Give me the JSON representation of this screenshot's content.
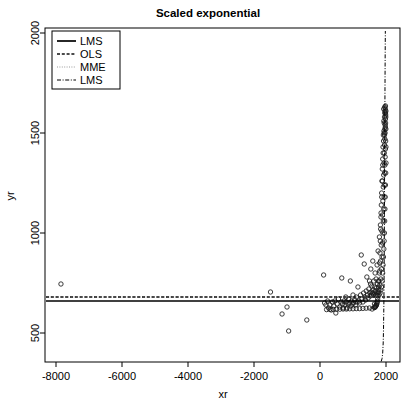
{
  "chart_data": {
    "type": "scatter",
    "title": "Scaled exponential",
    "xlabel": "xr",
    "ylabel": "yr",
    "grid": false,
    "xlim": [
      -8600,
      2300
    ],
    "ylim": [
      280,
      2030
    ],
    "xticks": [
      -8000,
      -6000,
      -4000,
      -2000,
      0,
      2000
    ],
    "xticklabels": [
      "-8000",
      "-6000",
      "-4000",
      "-2000",
      "0",
      "2000"
    ],
    "yticks": [
      500,
      1000,
      1500,
      2000
    ],
    "yticklabels": [
      "500",
      "1000",
      "1500",
      "2000"
    ],
    "legend": {
      "position": "top-left",
      "entries": [
        {
          "label": "LMS",
          "style": "solid"
        },
        {
          "label": "OLS",
          "style": "dashed"
        },
        {
          "label": "MME",
          "style": "dotted"
        },
        {
          "label": "LMS",
          "style": "dashdot"
        }
      ]
    },
    "series": [
      {
        "name": "data points",
        "type": "scatter",
        "marker": "open-circle",
        "points": [
          [
            -7850,
            745
          ],
          [
            -1500,
            705
          ],
          [
            -1150,
            595
          ],
          [
            -1000,
            630
          ],
          [
            -950,
            510
          ],
          [
            -400,
            565
          ],
          [
            110,
            790
          ],
          [
            140,
            650
          ],
          [
            180,
            640
          ],
          [
            230,
            660
          ],
          [
            260,
            625
          ],
          [
            300,
            640
          ],
          [
            340,
            615
          ],
          [
            380,
            655
          ],
          [
            420,
            635
          ],
          [
            450,
            660
          ],
          [
            480,
            600
          ],
          [
            520,
            645
          ],
          [
            560,
            670
          ],
          [
            600,
            630
          ],
          [
            640,
            655
          ],
          [
            660,
            775
          ],
          [
            680,
            645
          ],
          [
            700,
            625
          ],
          [
            730,
            660
          ],
          [
            760,
            640
          ],
          [
            780,
            680
          ],
          [
            800,
            655
          ],
          [
            820,
            625
          ],
          [
            850,
            645
          ],
          [
            870,
            670
          ],
          [
            900,
            650
          ],
          [
            920,
            760
          ],
          [
            940,
            635
          ],
          [
            960,
            660
          ],
          [
            980,
            645
          ],
          [
            1000,
            690
          ],
          [
            1020,
            650
          ],
          [
            1050,
            665
          ],
          [
            1080,
            640
          ],
          [
            1100,
            680
          ],
          [
            1120,
            655
          ],
          [
            1150,
            730
          ],
          [
            1180,
            660
          ],
          [
            1200,
            650
          ],
          [
            1230,
            690
          ],
          [
            1250,
            890
          ],
          [
            1270,
            670
          ],
          [
            1300,
            655
          ],
          [
            1320,
            700
          ],
          [
            1340,
            845
          ],
          [
            1360,
            680
          ],
          [
            1380,
            665
          ],
          [
            1400,
            710
          ],
          [
            1420,
            780
          ],
          [
            1440,
            690
          ],
          [
            1460,
            675
          ],
          [
            1480,
            720
          ],
          [
            1500,
            760
          ],
          [
            1510,
            700
          ],
          [
            1520,
            685
          ],
          [
            1530,
            745
          ],
          [
            1540,
            820
          ],
          [
            1550,
            705
          ],
          [
            1560,
            690
          ],
          [
            1570,
            735
          ],
          [
            1580,
            620
          ],
          [
            1590,
            700
          ],
          [
            1600,
            860
          ],
          [
            1610,
            715
          ],
          [
            1620,
            690
          ],
          [
            1630,
            760
          ],
          [
            1640,
            700
          ],
          [
            1650,
            645
          ],
          [
            1660,
            730
          ],
          [
            1670,
            800
          ],
          [
            1680,
            710
          ],
          [
            1690,
            690
          ],
          [
            1700,
            770
          ],
          [
            1710,
            725
          ],
          [
            1720,
            690
          ],
          [
            1730,
            840
          ],
          [
            1740,
            745
          ],
          [
            1750,
            700
          ],
          [
            1760,
            910
          ],
          [
            1770,
            760
          ],
          [
            1780,
            715
          ],
          [
            1790,
            690
          ],
          [
            1800,
            980
          ],
          [
            1810,
            810
          ],
          [
            1815,
            740
          ],
          [
            1820,
            700
          ],
          [
            1830,
            1040
          ],
          [
            1835,
            860
          ],
          [
            1840,
            770
          ],
          [
            1845,
            715
          ],
          [
            1850,
            1100
          ],
          [
            1855,
            940
          ],
          [
            1860,
            820
          ],
          [
            1865,
            730
          ],
          [
            1870,
            1180
          ],
          [
            1875,
            1010
          ],
          [
            1880,
            880
          ],
          [
            1885,
            760
          ],
          [
            1890,
            1260
          ],
          [
            1893,
            1090
          ],
          [
            1896,
            950
          ],
          [
            1899,
            800
          ],
          [
            1902,
            1340
          ],
          [
            1905,
            1160
          ],
          [
            1908,
            1000
          ],
          [
            1911,
            840
          ],
          [
            1914,
            1400
          ],
          [
            1917,
            1230
          ],
          [
            1920,
            1060
          ],
          [
            1923,
            880
          ],
          [
            1926,
            1460
          ],
          [
            1929,
            1290
          ],
          [
            1932,
            1120
          ],
          [
            1935,
            920
          ],
          [
            1938,
            1510
          ],
          [
            1940,
            1350
          ],
          [
            1942,
            1180
          ],
          [
            1944,
            960
          ],
          [
            1946,
            1550
          ],
          [
            1948,
            1400
          ],
          [
            1950,
            1240
          ],
          [
            1952,
            1000
          ],
          [
            1954,
            1580
          ],
          [
            1956,
            1440
          ],
          [
            1958,
            1300
          ],
          [
            1960,
            1060
          ],
          [
            1962,
            1600
          ],
          [
            1964,
            1470
          ],
          [
            1966,
            1340
          ],
          [
            1968,
            1120
          ],
          [
            1970,
            1610
          ],
          [
            1972,
            1500
          ],
          [
            1974,
            1380
          ],
          [
            1976,
            1180
          ],
          [
            1978,
            1620
          ],
          [
            1980,
            1530
          ],
          [
            1982,
            1420
          ],
          [
            1984,
            1240
          ],
          [
            1986,
            1600
          ],
          [
            1988,
            1550
          ],
          [
            1990,
            1460
          ],
          [
            1992,
            1300
          ],
          [
            1994,
            1580
          ],
          [
            1996,
            1520
          ],
          [
            1998,
            1430
          ],
          [
            2000,
            1350
          ],
          [
            1935,
            1560
          ],
          [
            1945,
            1500
          ],
          [
            1955,
            1490
          ],
          [
            1965,
            1520
          ],
          [
            1975,
            1540
          ],
          [
            1985,
            1570
          ],
          [
            1991,
            1590
          ],
          [
            1997,
            1610
          ],
          [
            1930,
            1620
          ],
          [
            1960,
            1630
          ],
          [
            1985,
            1635
          ],
          [
            1920,
            1490
          ],
          [
            1910,
            1430
          ],
          [
            1900,
            1370
          ],
          [
            1888,
            1320
          ],
          [
            1878,
            1260
          ],
          [
            1868,
            1200
          ],
          [
            1858,
            1140
          ],
          [
            1848,
            1080
          ],
          [
            1838,
            1020
          ],
          [
            1828,
            960
          ],
          [
            1818,
            900
          ],
          [
            1808,
            850
          ],
          [
            1798,
            800
          ],
          [
            1788,
            760
          ],
          [
            1778,
            730
          ],
          [
            1768,
            705
          ],
          [
            1758,
            685
          ],
          [
            1748,
            670
          ],
          [
            1738,
            658
          ],
          [
            1728,
            650
          ],
          [
            1718,
            644
          ],
          [
            1708,
            640
          ],
          [
            1698,
            637
          ],
          [
            1688,
            634
          ],
          [
            1678,
            632
          ],
          [
            1668,
            630
          ],
          [
            1658,
            628
          ],
          [
            1648,
            627
          ],
          [
            1500,
            625
          ],
          [
            1400,
            624
          ],
          [
            1300,
            623
          ],
          [
            1200,
            622
          ],
          [
            1100,
            622
          ],
          [
            1000,
            621
          ],
          [
            900,
            621
          ],
          [
            800,
            620
          ],
          [
            700,
            620
          ],
          [
            600,
            619
          ],
          [
            500,
            619
          ],
          [
            400,
            618
          ],
          [
            300,
            618
          ],
          [
            200,
            617
          ]
        ]
      },
      {
        "name": "LMS",
        "type": "line",
        "style": "solid",
        "description": "near-horizontal fitted line at y about 660",
        "y_value": 660
      },
      {
        "name": "OLS",
        "type": "line",
        "style": "dashed",
        "description": "near-horizontal fitted line at y about 680",
        "y_value": 680
      },
      {
        "name": "MME",
        "type": "line",
        "style": "dotted",
        "description": "overlaps the OLS line, faint dotted, y about 680",
        "y_value": 680
      },
      {
        "name": "LMS-curve",
        "type": "line",
        "style": "dashdot",
        "description": "flat baseline near y 345 rising almost vertically near xr 1950 up to y 2000",
        "baseline_y": 345,
        "rise_x": 1950,
        "top_y": 2000
      }
    ]
  }
}
